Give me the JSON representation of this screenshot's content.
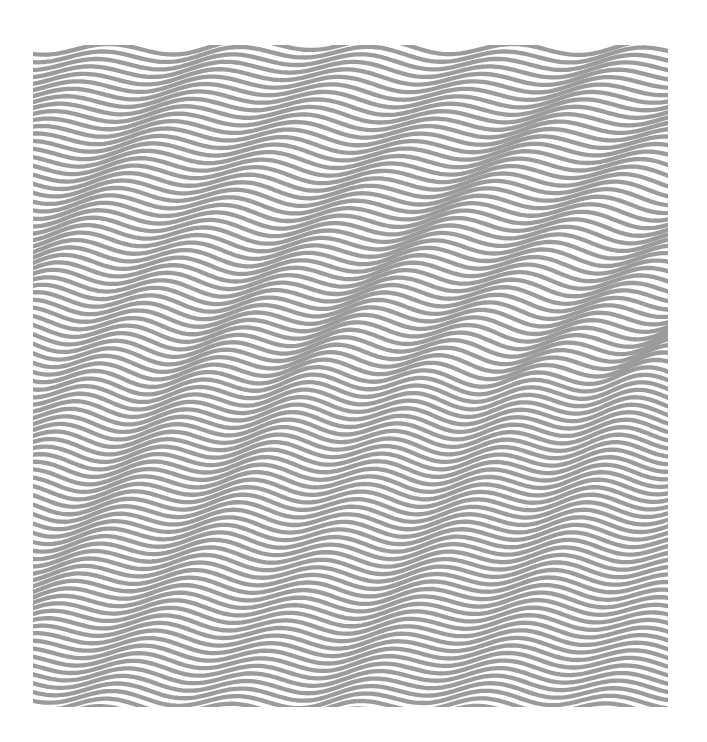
{
  "image": {
    "description": "Op-art pattern of horizontal wavy gray lines on white",
    "background_color": "#ffffff",
    "line_color": "#9b9b9b"
  },
  "artwork": {
    "x": 33,
    "y": 45,
    "width": 635,
    "height": 662,
    "line_count": 88,
    "line_spacing": 7.5,
    "stroke_width": 4.3,
    "amplitude": 7,
    "wave_period_top": 135,
    "wave_period_middle": 110,
    "wave_period_bottom": 125,
    "phase_drift_per_line": 0.045
  }
}
